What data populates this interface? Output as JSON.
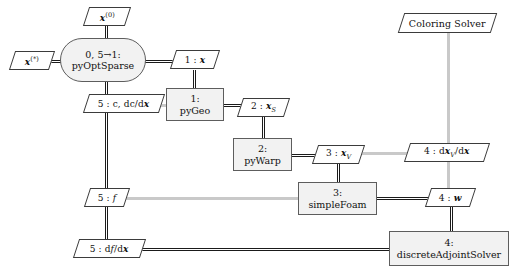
{
  "diagram": {
    "type": "xdsm",
    "background": "#ffffff",
    "colors": {
      "process_fill": "#f2f2f2",
      "process_stroke": "#5d5d5d",
      "data_fill": "#ffffff",
      "data_stroke": "#3b3b3b",
      "connector_dark": "#1a1a1a",
      "connector_light": "#c9c9c9"
    }
  },
  "nodes": [
    {
      "id": "pyoptsparse",
      "kind": "optimizer",
      "shape": "stadium",
      "number": "0, 5→1:",
      "name": "pyOptSparse"
    },
    {
      "id": "pygeo",
      "kind": "component",
      "shape": "rect",
      "number": "1:",
      "name": "pyGeo"
    },
    {
      "id": "pywarp",
      "kind": "component",
      "shape": "rect",
      "number": "2:",
      "name": "pyWarp"
    },
    {
      "id": "simplefoam",
      "kind": "component",
      "shape": "rect",
      "number": "3:",
      "name": "simpleFoam"
    },
    {
      "id": "discreteadjointsolver",
      "kind": "component",
      "shape": "rect",
      "number": "4:",
      "name": "discreteAdjointSolver"
    }
  ],
  "data_blocks": [
    {
      "id": "x0",
      "label": "x(0)",
      "text": "x⁽⁰⁾",
      "kind": "input"
    },
    {
      "id": "xstar",
      "label": "x(*)",
      "text": "x⁽*⁾",
      "kind": "output"
    },
    {
      "id": "x",
      "label": "1 : x",
      "text": "1 : x",
      "kind": "data"
    },
    {
      "id": "c_dcdx",
      "label": "5 : c, dc/dx",
      "text": "5 : c, dc/dx",
      "kind": "data"
    },
    {
      "id": "xs",
      "label": "2 : xS",
      "text": "2 : x_S",
      "kind": "data"
    },
    {
      "id": "xv",
      "label": "3 : xV",
      "text": "3 : x_V",
      "kind": "data"
    },
    {
      "id": "dxvdx",
      "label": "4 : dxV/dx",
      "text": "4 : dx_V/dx",
      "kind": "data"
    },
    {
      "id": "w",
      "label": "4 : w",
      "text": "4 : w",
      "kind": "data"
    },
    {
      "id": "f",
      "label": "5 : f",
      "text": "5 : f",
      "kind": "data"
    },
    {
      "id": "dfdx",
      "label": "5 : df/dx",
      "text": "5 : df/dx",
      "kind": "data"
    },
    {
      "id": "coloring",
      "label": "Coloring Solver",
      "text": "Coloring Solver",
      "kind": "solver"
    }
  ],
  "labels": {
    "x0": "x",
    "x0_sup": "(0)",
    "xstar": "x",
    "xstar_sup": "(*)",
    "x_num": "1 : ",
    "x_sym": "x",
    "c_text": "5 : c, dc/d",
    "c_sym": "x",
    "xs_num": "2 : ",
    "xs_sym": "x",
    "xs_sub": "S",
    "xv_num": "3 : ",
    "xv_sym": "x",
    "xv_sub": "V",
    "dxv_num": "4 : d",
    "dxv_sym": "x",
    "dxv_sub": "V",
    "dxv_tail": "/d",
    "dxv_tail_sym": "x",
    "w_num": "4 : ",
    "w_sym": "w",
    "f_num": "5 : ",
    "f_sym": "f",
    "dfdx_num": "5 : d",
    "dfdx_sym": "f",
    "dfdx_tail": "/d",
    "dfdx_tail_sym": "x",
    "coloring": "Coloring Solver",
    "opt_num": "0, 5→1:",
    "opt_name": "pyOptSparse",
    "pygeo_num": "1:",
    "pygeo_name": "pyGeo",
    "pywarp_num": "2:",
    "pywarp_name": "pyWarp",
    "simplefoam_num": "3:",
    "simplefoam_name": "simpleFoam",
    "das_num": "4:",
    "das_name": "discreteAdjointSolver"
  }
}
